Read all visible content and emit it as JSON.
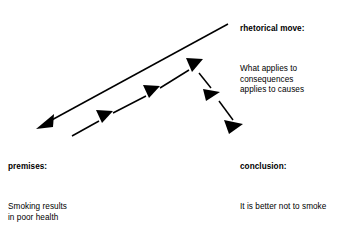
{
  "diagram": {
    "background_color": "#ffffff",
    "stroke_color": "#000000",
    "blocks": {
      "rhetorical": {
        "heading": "rhetorical move:",
        "body_lines": [
          "What applies to",
          "consequences",
          "applies to causes"
        ]
      },
      "premises": {
        "heading": "premises:",
        "body_lines_1": [
          "Smoking results",
          "in poor health"
        ],
        "body_lines_2": [
          "Poor health is",
          "undesirable"
        ]
      },
      "conclusion": {
        "heading": "conclusion:",
        "body_lines": [
          "It is better not to smoke"
        ]
      }
    },
    "arrows": {
      "main": {
        "name": "premises-from-conclusion-arrow",
        "description": "long solid arrow pointing down-left",
        "tail": [
          228,
          24
        ],
        "head": [
          37,
          128
        ]
      },
      "chain": {
        "name": "rhetorical-move-chain-arrow",
        "description": "segmented chain of arrows rising then falling",
        "points": [
          [
            72,
            135
          ],
          [
            105,
            117
          ],
          [
            152,
            92
          ],
          [
            195,
            65
          ],
          [
            212,
            95
          ],
          [
            240,
            130
          ]
        ]
      }
    }
  }
}
